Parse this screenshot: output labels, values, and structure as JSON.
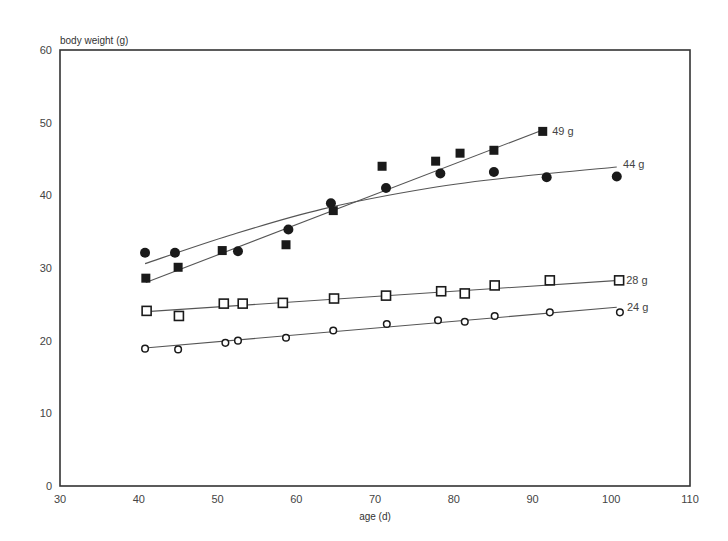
{
  "chart_data": {
    "type": "scatter",
    "title": "",
    "xlabel": "age (d)",
    "ylabel": "body weight (g)",
    "xlim": [
      30,
      110
    ],
    "ylim": [
      0,
      60
    ],
    "xticks": [
      30,
      40,
      50,
      60,
      70,
      80,
      90,
      100,
      110
    ],
    "yticks": [
      0,
      10,
      20,
      30,
      40,
      50,
      60
    ],
    "grid": false,
    "legend": "none (series labelled at line ends)",
    "series": [
      {
        "name": "49 g",
        "marker": "filled-square",
        "x": [
          40.9,
          45.0,
          50.6,
          58.7,
          64.7,
          70.9,
          77.7,
          80.8,
          85.1,
          91.3
        ],
        "y": [
          28.6,
          30.1,
          32.4,
          33.2,
          37.9,
          44.0,
          44.7,
          45.8,
          46.2,
          48.8
        ],
        "fit": {
          "type": "linear",
          "x": [
            40.9,
            91.3
          ],
          "y": [
            28.0,
            49.0
          ]
        },
        "label_pos": [
          92.5,
          48.8
        ]
      },
      {
        "name": "44 g",
        "marker": "filled-circle",
        "x": [
          40.8,
          44.6,
          52.6,
          59.0,
          64.4,
          71.4,
          78.3,
          85.1,
          91.8,
          100.7
        ],
        "y": [
          32.1,
          32.1,
          32.3,
          35.3,
          38.9,
          41.0,
          43.0,
          43.2,
          42.5,
          42.6
        ],
        "fit": {
          "type": "curve",
          "x": [
            40.8,
            51.6,
            63.3,
            77.0,
            88.4,
            100.7
          ],
          "y": [
            30.6,
            34.5,
            38.1,
            41.0,
            42.6,
            43.9
          ]
        },
        "label_pos": [
          101.5,
          44.3
        ]
      },
      {
        "name": "28 g",
        "marker": "open-square",
        "x": [
          41.0,
          45.1,
          50.8,
          53.2,
          58.3,
          64.8,
          71.4,
          78.4,
          81.4,
          85.2,
          92.2,
          101.0
        ],
        "y": [
          24.1,
          23.4,
          25.1,
          25.1,
          25.2,
          25.8,
          26.2,
          26.8,
          26.5,
          27.6,
          28.3,
          28.3
        ],
        "fit": {
          "type": "linear",
          "x": [
            41.0,
            101.0
          ],
          "y": [
            24.0,
            28.3
          ]
        },
        "label_pos": [
          101.9,
          28.3
        ]
      },
      {
        "name": "24 g",
        "marker": "open-circle",
        "x": [
          40.8,
          45.0,
          51.0,
          52.6,
          58.7,
          64.7,
          71.5,
          78.0,
          81.4,
          85.2,
          92.2,
          101.1
        ],
        "y": [
          18.9,
          18.8,
          19.7,
          20.0,
          20.4,
          21.4,
          22.3,
          22.8,
          22.6,
          23.4,
          23.9,
          23.9
        ],
        "fit": {
          "type": "linear",
          "x": [
            40.8,
            100.7
          ],
          "y": [
            19.0,
            24.6
          ]
        },
        "label_pos": [
          102.0,
          24.6
        ]
      }
    ]
  },
  "colors": {
    "axis": "#333333",
    "marker": "#1a1a1a",
    "fit_line": "#555555",
    "text": "#444444",
    "background": "#ffffff"
  }
}
